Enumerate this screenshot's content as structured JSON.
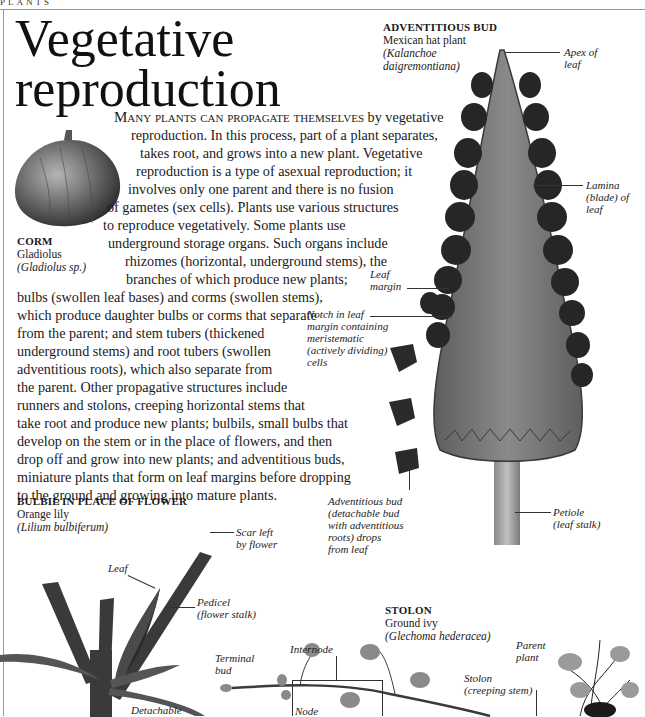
{
  "page": {
    "section_tag": "PLANTS",
    "title_line1": "Vegetative",
    "title_line2": "reproduction"
  },
  "body": {
    "lead": "Many plants can propagate themselves",
    "lines": [
      " by vegetative",
      "reproduction. In this process, part of a plant separates,",
      "takes root, and grows into a new plant. Vegetative",
      "reproduction is a type of asexual reproduction;  it",
      "involves only one parent and there is no fusion",
      "of gametes (sex cells). Plants use various structures",
      "to reproduce vegetatively. Some plants use",
      "underground storage organs. Such organs include",
      "rhizomes (horizontal, underground stems), the",
      "branches of which produce new plants;",
      "bulbs (swollen leaf bases) and corms (swollen stems),",
      "which produce daughter bulbs or corms that separate",
      "from the parent; and stem tubers (thickened",
      "underground stems) and root tubers (swollen",
      "adventitious roots), which also separate from",
      "the parent. Other propagative structures include",
      "runners and stolons, creeping horizontal stems that",
      "take root and produce new plants; bulbils, small bulbs that",
      "develop on the stem or in the place of flowers, and then",
      "drop off and grow into new plants; and adventitious buds,",
      "miniature plants that form on leaf margins before dropping",
      "to the ground and growing into mature plants."
    ]
  },
  "corm": {
    "heading": "CORM",
    "common_name": "Gladiolus",
    "latin_name": "(Gladiolus sp.)"
  },
  "adventitious_bud": {
    "heading": "ADVENTITIOUS BUD",
    "common_name": "Mexican hat plant",
    "latin_line1": "(Kalanchoe",
    "latin_line2": "daigremontiana)",
    "labels": {
      "apex": [
        "Apex of",
        "leaf"
      ],
      "lamina": [
        "Lamina",
        "(blade) of",
        "leaf"
      ],
      "leaf_margin": [
        "Leaf",
        "margin"
      ],
      "notch": [
        "Notch in leaf",
        "margin containing",
        "meristematic",
        "(actively dividing)",
        "cells"
      ],
      "bud_drop": [
        "Adventitious bud",
        "(detachable bud",
        "with adventitious",
        "roots) drops",
        "from leaf"
      ],
      "petiole": [
        "Petiole",
        "(leaf stalk)"
      ]
    }
  },
  "bulbil": {
    "heading": "BULBIL IN PLACE OF FLOWER",
    "common_name": "Orange lily",
    "latin_name": "(Lilium bulbiferum)",
    "labels": {
      "scar": [
        "Scar left",
        "by flower"
      ],
      "leaf": "Leaf",
      "pedicel": [
        "Pedicel",
        "(flower stalk)"
      ],
      "detachable": "Detachable"
    }
  },
  "stolon": {
    "heading": "STOLON",
    "common_name": "Ground ivy",
    "latin_name": "(Glechoma hederacea)",
    "labels": {
      "internode": "Internode",
      "terminal_bud": [
        "Terminal",
        "bud"
      ],
      "node": "Node",
      "stolon": [
        "Stolon",
        "(creeping stem)"
      ],
      "parent_plant": [
        "Parent",
        "plant"
      ]
    }
  },
  "colors": {
    "text": "#1a1a1a",
    "rule": "#999999",
    "leaf_fill": "#7a7a7a",
    "bud_fill": "#262626",
    "corm_fill": "#6b6b6b"
  }
}
